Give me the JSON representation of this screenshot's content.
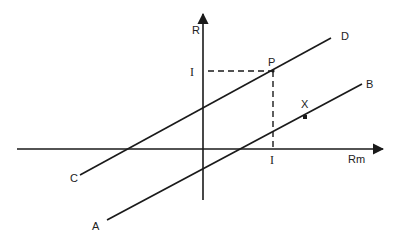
{
  "diagram": {
    "type": "line-graph-sketch",
    "axes": {
      "y_label": "R",
      "x_label": "Rm"
    },
    "lines": [
      {
        "id": "CD",
        "start_label": "C",
        "end_label": "D"
      },
      {
        "id": "AB",
        "start_label": "A",
        "end_label": "B"
      }
    ],
    "points": [
      {
        "id": "P",
        "label": "P",
        "on_line": "CD"
      },
      {
        "id": "X",
        "label": "X",
        "on_line": "AB"
      }
    ],
    "projections": {
      "y_tick_label": "I",
      "x_tick_label": "I",
      "style": "dashed"
    },
    "colors": {
      "stroke": "#1a1a1a",
      "text": "#222222",
      "background": "#ffffff"
    }
  }
}
